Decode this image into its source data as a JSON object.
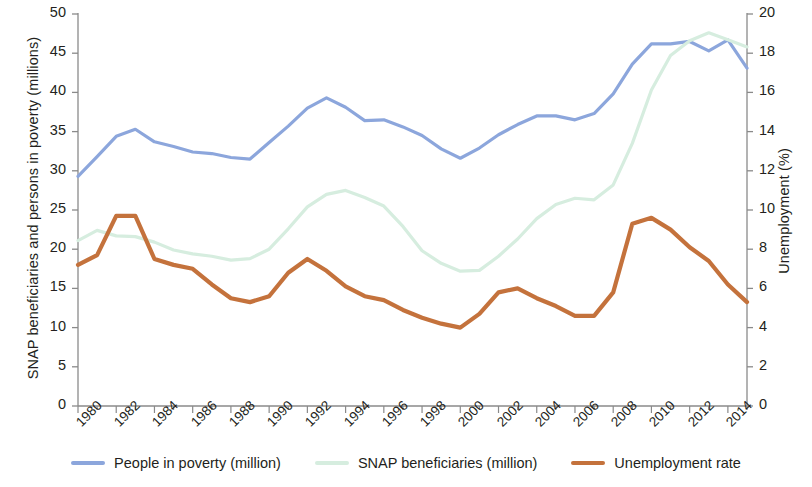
{
  "chart_data": {
    "type": "line",
    "title": "",
    "xlabel": "",
    "ylabel": "SNAP beneficiaries and persons in poverty (millions)",
    "y2label": "Unemployment (%)",
    "xlim": [
      1980,
      2015
    ],
    "ylim": [
      0,
      50
    ],
    "y2lim": [
      0,
      20
    ],
    "grid": false,
    "legend_position": "bottom",
    "x": [
      1980,
      1981,
      1982,
      1983,
      1984,
      1985,
      1986,
      1987,
      1988,
      1989,
      1990,
      1991,
      1992,
      1993,
      1994,
      1995,
      1996,
      1997,
      1998,
      1999,
      2000,
      2001,
      2002,
      2003,
      2004,
      2005,
      2006,
      2007,
      2008,
      2009,
      2010,
      2011,
      2012,
      2013,
      2014,
      2015
    ],
    "xticks": [
      1980,
      1982,
      1984,
      1986,
      1988,
      1990,
      1992,
      1994,
      1996,
      1998,
      2000,
      2002,
      2004,
      2006,
      2008,
      2010,
      2012,
      2014
    ],
    "xticklabels": [
      "1980",
      "1982",
      "1984",
      "1986",
      "1988",
      "1990",
      "1992",
      "1994",
      "1996",
      "1998",
      "2000",
      "2002",
      "2004",
      "2006",
      "2008",
      "2010",
      "2012",
      "2014"
    ],
    "yticks": [
      0,
      5,
      10,
      15,
      20,
      25,
      30,
      35,
      40,
      45,
      50
    ],
    "yticklabels": [
      "0",
      "5",
      "10",
      "15",
      "20",
      "25",
      "30",
      "35",
      "40",
      "45",
      "50"
    ],
    "y2ticks": [
      0,
      2,
      4,
      6,
      8,
      10,
      12,
      14,
      16,
      18,
      20
    ],
    "y2ticklabels": [
      "0",
      "2",
      "4",
      "6",
      "8",
      "10",
      "12",
      "14",
      "16",
      "18",
      "20"
    ],
    "series": [
      {
        "name": "People in poverty (million)",
        "axis": "left",
        "color": "#8CA6DC",
        "values": [
          29.3,
          31.8,
          34.4,
          35.3,
          33.7,
          33.1,
          32.4,
          32.2,
          31.7,
          31.5,
          33.6,
          35.7,
          38.0,
          39.3,
          38.1,
          36.4,
          36.5,
          35.6,
          34.5,
          32.8,
          31.6,
          32.9,
          34.6,
          35.9,
          37.0,
          37.0,
          36.5,
          37.3,
          39.8,
          43.6,
          46.2,
          46.2,
          46.5,
          45.3,
          46.7,
          43.1
        ]
      },
      {
        "name": "SNAP beneficiaries (million)",
        "axis": "left",
        "color": "#D6EDDF",
        "values": [
          21.1,
          22.4,
          21.7,
          21.6,
          20.9,
          19.9,
          19.4,
          19.1,
          18.6,
          18.8,
          20.0,
          22.6,
          25.4,
          27.0,
          27.5,
          26.6,
          25.5,
          22.9,
          19.8,
          18.2,
          17.2,
          17.3,
          19.1,
          21.3,
          23.9,
          25.7,
          26.5,
          26.3,
          28.2,
          33.5,
          40.3,
          44.7,
          46.6,
          47.6,
          46.7,
          45.8
        ]
      },
      {
        "name": "Unemployment rate",
        "axis": "right",
        "color": "#C4723C",
        "values": [
          7.2,
          7.7,
          9.7,
          9.7,
          7.5,
          7.2,
          7.0,
          6.2,
          5.5,
          5.3,
          5.6,
          6.8,
          7.5,
          6.9,
          6.1,
          5.6,
          5.4,
          4.9,
          4.5,
          4.2,
          4.0,
          4.7,
          5.8,
          6.0,
          5.5,
          5.1,
          4.6,
          4.6,
          5.8,
          9.3,
          9.6,
          9.0,
          8.1,
          7.4,
          6.2,
          5.3
        ]
      }
    ]
  },
  "legend": {
    "items": [
      {
        "label": "People in poverty (million)",
        "color": "#8CA6DC"
      },
      {
        "label": "SNAP beneficiaries (million)",
        "color": "#D6EDDF"
      },
      {
        "label": "Unemployment rate",
        "color": "#C4723C"
      }
    ]
  }
}
